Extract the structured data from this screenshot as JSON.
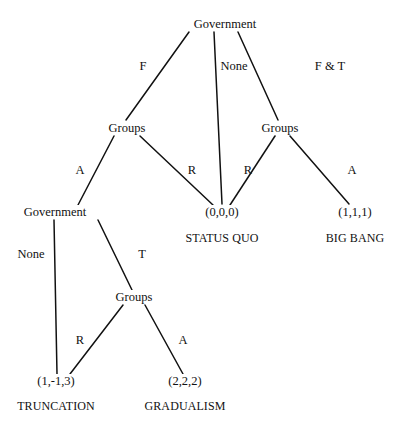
{
  "diagram": {
    "type": "game-tree",
    "line_color": "#111111",
    "background": "#ffffff",
    "nodes": [
      {
        "id": "gov_root",
        "label": "Government",
        "x": 225,
        "y": 24
      },
      {
        "id": "groups_left",
        "label": "Groups",
        "x": 127,
        "y": 128
      },
      {
        "id": "groups_right",
        "label": "Groups",
        "x": 280,
        "y": 128
      },
      {
        "id": "gov_second",
        "label": "Government",
        "x": 55,
        "y": 212
      },
      {
        "id": "groups_lower",
        "label": "Groups",
        "x": 134,
        "y": 297
      }
    ],
    "edge_labels": [
      {
        "id": "edge_F",
        "label": "F",
        "x": 143,
        "y": 66
      },
      {
        "id": "edge_None_top",
        "label": "None",
        "x": 234,
        "y": 66
      },
      {
        "id": "edge_FT",
        "label": "F & T",
        "x": 330,
        "y": 66
      },
      {
        "id": "edge_A_left",
        "label": "A",
        "x": 80,
        "y": 170
      },
      {
        "id": "edge_R_left",
        "label": "R",
        "x": 192,
        "y": 170
      },
      {
        "id": "edge_R_right",
        "label": "R",
        "x": 248,
        "y": 170
      },
      {
        "id": "edge_A_right",
        "label": "A",
        "x": 352,
        "y": 170
      },
      {
        "id": "edge_None_lower",
        "label": "None",
        "x": 31,
        "y": 254
      },
      {
        "id": "edge_T",
        "label": "T",
        "x": 142,
        "y": 254
      },
      {
        "id": "edge_R_lower",
        "label": "R",
        "x": 80,
        "y": 340
      },
      {
        "id": "edge_A_lower",
        "label": "A",
        "x": 183,
        "y": 340
      }
    ],
    "terminals": [
      {
        "id": "status_quo",
        "payoff": "(0,0,0)",
        "outcome": "STATUS QUO",
        "x": 222,
        "y": 212,
        "oy": 238
      },
      {
        "id": "big_bang",
        "payoff": "(1,1,1)",
        "outcome": "BIG BANG",
        "x": 355,
        "y": 212,
        "oy": 238
      },
      {
        "id": "truncation",
        "payoff": "(1,-1,3)",
        "outcome": "TRUNCATION",
        "x": 56,
        "y": 381,
        "oy": 406
      },
      {
        "id": "gradualism",
        "payoff": "(2,2,2)",
        "outcome": "GRADUALISM",
        "x": 185,
        "y": 381,
        "oy": 406
      }
    ],
    "edges": [
      {
        "from": "gov_root",
        "to": "groups_left",
        "label": "F",
        "x1": 189,
        "y1": 32,
        "x2": 126,
        "y2": 120
      },
      {
        "from": "gov_root",
        "to": "status_quo",
        "label": "None",
        "x1": 214,
        "y1": 32,
        "x2": 222,
        "y2": 204
      },
      {
        "from": "gov_root",
        "to": "groups_right",
        "label": "F & T",
        "x1": 238,
        "y1": 32,
        "x2": 278,
        "y2": 120
      },
      {
        "from": "groups_left",
        "to": "gov_second",
        "label": "A",
        "x1": 114,
        "y1": 136,
        "x2": 78,
        "y2": 205
      },
      {
        "from": "groups_left",
        "to": "status_quo",
        "label": "R",
        "x1": 140,
        "y1": 136,
        "x2": 213,
        "y2": 205
      },
      {
        "from": "groups_right",
        "to": "status_quo",
        "label": "R",
        "x1": 275,
        "y1": 136,
        "x2": 230,
        "y2": 205
      },
      {
        "from": "groups_right",
        "to": "big_bang",
        "label": "A",
        "x1": 290,
        "y1": 136,
        "x2": 349,
        "y2": 204
      },
      {
        "from": "gov_second",
        "to": "truncation",
        "label": "None",
        "x1": 54,
        "y1": 220,
        "x2": 57,
        "y2": 374
      },
      {
        "from": "gov_second",
        "to": "groups_lower",
        "label": "T",
        "x1": 98,
        "y1": 220,
        "x2": 132,
        "y2": 290
      },
      {
        "from": "groups_lower",
        "to": "truncation",
        "label": "R",
        "x1": 123,
        "y1": 305,
        "x2": 70,
        "y2": 374
      },
      {
        "from": "groups_lower",
        "to": "gradualism",
        "label": "A",
        "x1": 145,
        "y1": 305,
        "x2": 183,
        "y2": 374
      }
    ]
  }
}
